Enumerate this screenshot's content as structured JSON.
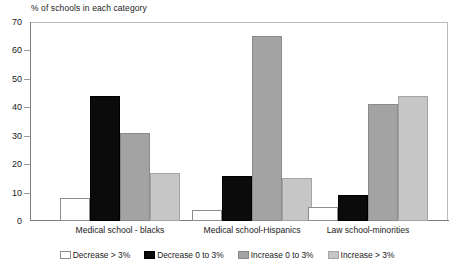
{
  "chart_data": {
    "type": "bar",
    "title": "% of schools in each category",
    "xlabel": "",
    "ylabel": "",
    "ylim": [
      0,
      70
    ],
    "yticks": [
      0,
      10,
      20,
      30,
      40,
      50,
      60,
      70
    ],
    "grid": false,
    "legend_position": "bottom",
    "categories": [
      "Medical school - blacks",
      "Medical school-Hispanics",
      "Law school-minorities"
    ],
    "series": [
      {
        "name": "Decrease > 3%",
        "color": "#ffffff",
        "values": [
          8,
          4,
          5
        ]
      },
      {
        "name": "Decrease 0 to 3%",
        "color": "#0b0b0b",
        "values": [
          44,
          16,
          9
        ]
      },
      {
        "name": "Increase 0 to 3%",
        "color": "#a3a3a3",
        "values": [
          31,
          65,
          41
        ]
      },
      {
        "name": "Increase > 3%",
        "color": "#c6c6c6",
        "values": [
          17,
          15,
          44
        ]
      }
    ]
  },
  "axis": {
    "y_tick_labels": [
      "70",
      "60",
      "50",
      "40",
      "30",
      "20",
      "10",
      "0"
    ]
  }
}
